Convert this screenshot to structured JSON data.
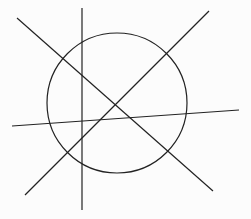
{
  "diagram": {
    "stroke_color": "#222222",
    "background": "#fcfcfc",
    "circle": {
      "cx": 117,
      "cy": 103,
      "r": 70
    },
    "lines": [
      {
        "name": "vertical-line",
        "x1": 82,
        "y1": 8,
        "x2": 82,
        "y2": 210
      },
      {
        "name": "diagonal-descending-line",
        "x1": 17,
        "y1": 18,
        "x2": 213,
        "y2": 191
      },
      {
        "name": "diagonal-ascending-line",
        "x1": 25,
        "y1": 195,
        "x2": 209,
        "y2": 11
      },
      {
        "name": "near-horizontal-line",
        "x1": 12,
        "y1": 126,
        "x2": 239,
        "y2": 110
      }
    ]
  }
}
